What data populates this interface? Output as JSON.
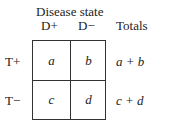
{
  "header": {
    "title": "Disease state",
    "col_pos": "D+",
    "col_neg": "D−",
    "totals": "Totals"
  },
  "rows": [
    {
      "label": "T+",
      "cells": [
        "a",
        "b"
      ],
      "total": "a + b"
    },
    {
      "label": "T−",
      "cells": [
        "c",
        "d"
      ],
      "total": "c + d"
    }
  ]
}
